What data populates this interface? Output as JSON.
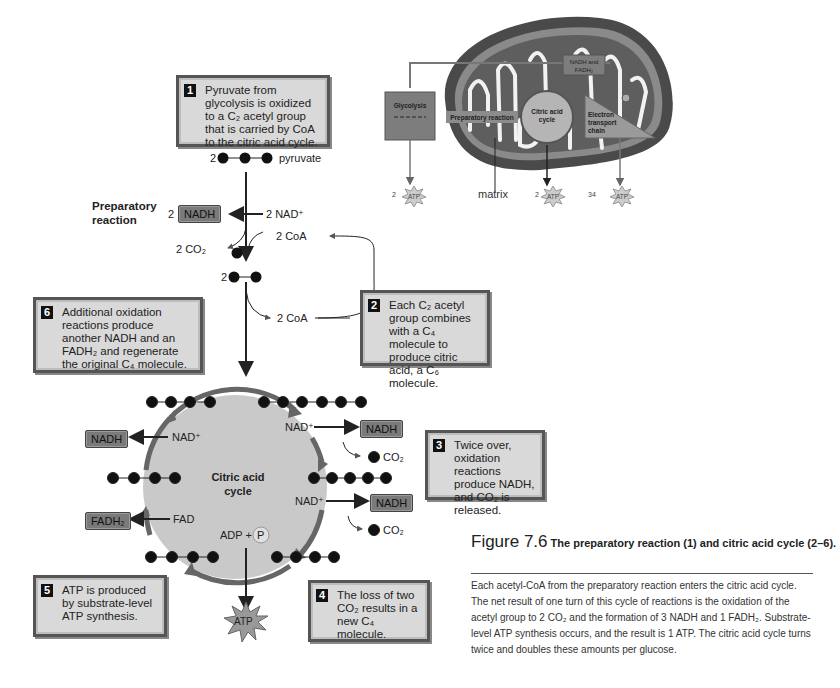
{
  "overview": {
    "glycolysis": "Glycolysis",
    "preparatory": "Preparatory reaction",
    "citric": "Citric acid cycle",
    "etc": "Electron transport chain",
    "nadh_fadh": "NADH and FADH₂",
    "matrix": "matrix",
    "atp": [
      {
        "count": "2",
        "label": "ATP"
      },
      {
        "count": "2",
        "label": "ATP"
      },
      {
        "count": "34",
        "label": "ATP"
      }
    ]
  },
  "steps": {
    "s1": {
      "num": "1",
      "text": "Pyruvate from glycolysis is oxidized to a C₂ acetyl group that is carried by CoA to the citric acid cycle."
    },
    "s2": {
      "num": "2",
      "text": "Each C₂ acetyl group combines with a C₄ molecule to produce citric acid, a C₆ molecule."
    },
    "s3": {
      "num": "3",
      "text": "Twice over, oxidation reactions produce NADH, and CO₂ is released."
    },
    "s4": {
      "num": "4",
      "text": "The loss of two CO₂ results in a new C₄ molecule."
    },
    "s5": {
      "num": "5",
      "text": "ATP is produced by substrate-level ATP synthesis."
    },
    "s6": {
      "num": "6",
      "text": "Additional oxidation reactions produce another NADH and an FADH₂ and regenerate the original C₄ molecule."
    }
  },
  "prep": {
    "title": "Preparatory reaction",
    "pyruvate_coef": "2",
    "pyruvate": "pyruvate",
    "nadh_coef": "2",
    "nadh": "NADH",
    "nad": "2 NAD⁺",
    "co2": "2 CO₂",
    "coa_top": "2 CoA",
    "acetyl_coef": "2",
    "coa_bottom": "2 CoA"
  },
  "cycle": {
    "center": "Citric acid cycle",
    "nadh": "NADH",
    "nad": "NAD⁺",
    "fadh2": "FADH₂",
    "fad": "FAD",
    "co2": "CO₂",
    "adp": "ADP +",
    "p": "P",
    "atp": "ATP"
  },
  "caption": {
    "fig": "Figure 7.6",
    "title": "The preparatory reaction (1) and citric acid cycle (2–6).",
    "body": "Each acetyl-CoA from the preparatory reaction enters the citric acid cycle. The net result of one turn of this cycle of reactions is the oxidation of the acetyl group to 2 CO₂ and the formation of 3 NADH and 1 FADH₂. Substrate-level ATP synthesis occurs, and the result is 1 ATP. The citric acid cycle turns twice and doubles these amounts per glucose."
  }
}
